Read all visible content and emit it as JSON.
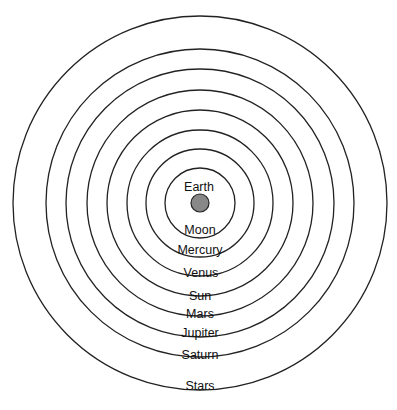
{
  "diagram": {
    "center": {
      "x": 200,
      "y": 203
    },
    "earth": {
      "label": "Earth",
      "radius": 9,
      "fill": "#888888"
    },
    "spheres": [
      {
        "label": "Moon",
        "radius": 35
      },
      {
        "label": "Mercury",
        "radius": 54
      },
      {
        "label": "Venus",
        "radius": 73
      },
      {
        "label": "Sun",
        "radius": 93
      },
      {
        "label": "Mars",
        "radius": 113
      },
      {
        "label": "Jupiter",
        "radius": 134
      },
      {
        "label": "Saturn",
        "radius": 154
      },
      {
        "label": "Stars",
        "radius": 187
      }
    ],
    "stroke_color": "#222222"
  }
}
